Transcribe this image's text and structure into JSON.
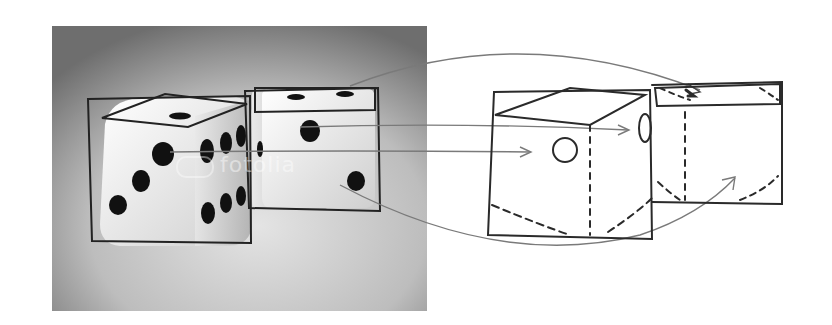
{
  "figure": {
    "description": "Photo of two dice with sketch overlay, arrows mapping to a hand-drawn perspective sketch",
    "photo": {
      "watermark": "fotolia",
      "background_gradient": [
        "#6e6e6e",
        "#d8d8d8"
      ],
      "dice": [
        {
          "name": "front-die",
          "visible_faces": {
            "top": 1,
            "front": 5,
            "side": 6
          }
        },
        {
          "name": "back-die",
          "visible_faces": {
            "top": 2,
            "front": 2
          }
        }
      ]
    },
    "sketch": {
      "stroke_color": "#2a2a2a",
      "arrow_color": "#7a7a7a",
      "boxes": [
        "front-cube-sketch",
        "back-cube-sketch"
      ]
    },
    "arrows": [
      {
        "from": "back-die-top",
        "to": "back-cube-sketch-top"
      },
      {
        "from": "back-die-front-pip",
        "to": "front-cube-side-pip"
      },
      {
        "from": "front-die-front-pip",
        "to": "front-cube-front-pip"
      },
      {
        "from": "back-die-lower-pip",
        "to": "back-cube-sketch-front"
      }
    ]
  }
}
